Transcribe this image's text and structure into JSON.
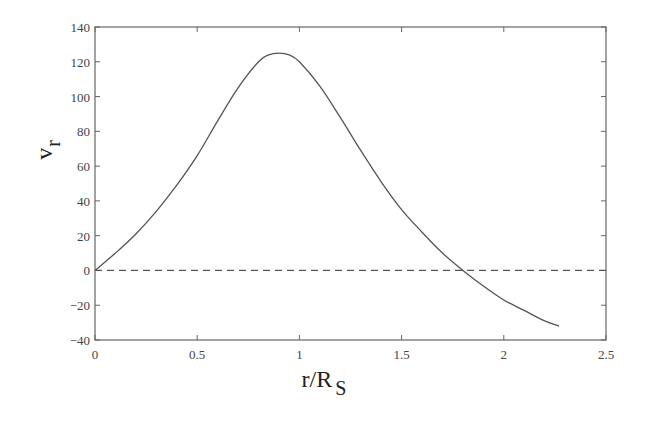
{
  "chart_data": {
    "type": "line",
    "title": "",
    "xlabel": "r/R",
    "xlabel_subscript": "S",
    "ylabel": "v",
    "ylabel_subscript": "r",
    "xlim": [
      0,
      2.5
    ],
    "ylim": [
      -40,
      140
    ],
    "x_ticks": [
      0,
      0.5,
      1,
      1.5,
      2,
      2.5
    ],
    "x_tick_labels": [
      "0",
      "0.5",
      "1",
      "1.5",
      "2",
      "2.5"
    ],
    "y_ticks": [
      -40,
      -20,
      0,
      20,
      40,
      60,
      80,
      100,
      120,
      140
    ],
    "y_tick_labels": [
      "-40",
      "-20",
      "0",
      "20",
      "40",
      "60",
      "80",
      "100",
      "120",
      "140"
    ],
    "grid": false,
    "legend": null,
    "series": [
      {
        "name": "v_r",
        "style": "solid",
        "color": "#555555",
        "x": [
          0,
          0.1,
          0.2,
          0.3,
          0.4,
          0.5,
          0.6,
          0.7,
          0.8,
          0.85,
          0.9,
          0.95,
          1.0,
          1.1,
          1.2,
          1.3,
          1.4,
          1.5,
          1.6,
          1.7,
          1.8,
          1.9,
          2.0,
          2.1,
          2.2,
          2.27
        ],
        "y": [
          0,
          10,
          21,
          34,
          49,
          66,
          86,
          105,
          120,
          124,
          125,
          124,
          120,
          106,
          88,
          69,
          51,
          35,
          22,
          10,
          0,
          -9,
          -17,
          -23,
          -29,
          -32
        ]
      },
      {
        "name": "zero-line",
        "style": "dashed",
        "color": "#555555",
        "x": [
          0,
          2.5
        ],
        "y": [
          0,
          0
        ]
      }
    ]
  }
}
